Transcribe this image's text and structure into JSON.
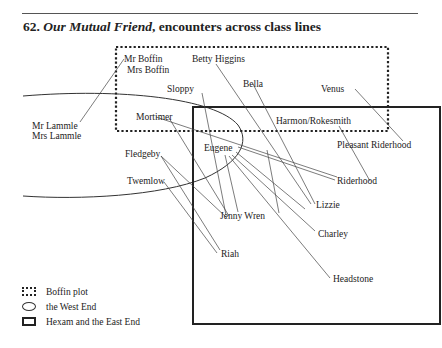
{
  "figure": {
    "number": "62.",
    "title_italic": "Our Mutual Friend",
    "title_rest": ", encounters across class lines"
  },
  "legend": [
    {
      "style": "dotted-rectangle",
      "label": "Boffin plot"
    },
    {
      "style": "ellipse",
      "label": "the West End"
    },
    {
      "style": "solid-rectangle",
      "label": "Hexam and the East End"
    }
  ],
  "characters": {
    "mr_boffin": "Mr Boffin",
    "mrs_boffin": "Mrs Boffin",
    "betty_higgins": "Betty Higgins",
    "sloppy": "Sloppy",
    "bella": "Bella",
    "venus": "Venus",
    "mr_lammle": "Mr Lammle",
    "mrs_lammle": "Mrs Lammle",
    "mortimer": "Mortimer",
    "harmon_rokesmith": "Harmon/Rokesmith",
    "pleasant_riderhood": "Pleasant Riderhood",
    "eugene": "Eugene",
    "fledgeby": "Fledgeby",
    "twemlow": "Twemlow",
    "riderhood": "Riderhood",
    "lizzie": "Lizzie",
    "jenny_wren": "Jenny Wren",
    "charley": "Charley",
    "riah": "Riah",
    "headstone": "Headstone"
  },
  "encounters": [
    [
      "Mr Lammle/Mrs Lammle",
      "Mr Boffin/Mrs Boffin"
    ],
    [
      "Betty Higgins",
      "Lizzie"
    ],
    [
      "Bella",
      "Lizzie"
    ],
    [
      "Venus",
      "Pleasant Riderhood"
    ],
    [
      "Harmon/Rokesmith",
      "Riderhood"
    ],
    [
      "Sloppy",
      "Jenny Wren"
    ],
    [
      "Mortimer",
      "Riderhood"
    ],
    [
      "Mortimer",
      "Jenny Wren"
    ],
    [
      "Eugene",
      "Riderhood"
    ],
    [
      "Eugene",
      "Lizzie"
    ],
    [
      "Eugene",
      "Jenny Wren"
    ],
    [
      "Eugene",
      "Charley"
    ],
    [
      "Eugene",
      "Headstone"
    ],
    [
      "Fledgeby",
      "Jenny Wren"
    ],
    [
      "Fledgeby",
      "Riah"
    ],
    [
      "Twemlow",
      "Riah"
    ]
  ],
  "colors": {
    "ink": "#222222",
    "background": "#ffffff"
  }
}
